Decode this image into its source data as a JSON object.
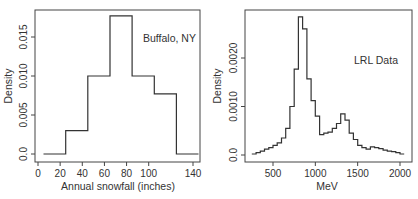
{
  "chart_data": [
    {
      "type": "bar",
      "subtype": "histogram",
      "title": "",
      "annotation": "Buffalo, NY",
      "xlabel": "Annual snowfall (inches)",
      "ylabel": "Density",
      "xticks": [
        0,
        20,
        40,
        60,
        80,
        100,
        140
      ],
      "yticks": [
        "0.0",
        "0.005",
        "0.010",
        "0.015"
      ],
      "xlim": [
        0,
        150
      ],
      "ylim": [
        0,
        0.018
      ],
      "grid": false,
      "bin_edges": [
        5,
        25,
        45,
        65,
        85,
        105,
        125,
        145
      ],
      "values": [
        0.0,
        0.003,
        0.01,
        0.0177,
        0.01,
        0.0077,
        0.0
      ]
    },
    {
      "type": "bar",
      "subtype": "histogram",
      "title": "",
      "annotation": "LRL Data",
      "xlabel": "MeV",
      "ylabel": "Density",
      "xticks": [
        500,
        1000,
        1500,
        2000
      ],
      "yticks": [
        "0.0",
        "0.0010",
        "0.0020"
      ],
      "xlim": [
        200,
        2100
      ],
      "ylim": [
        0,
        0.0029
      ],
      "grid": false,
      "bin_edges": [
        250,
        300,
        350,
        400,
        450,
        500,
        550,
        600,
        650,
        700,
        750,
        800,
        850,
        900,
        950,
        1000,
        1050,
        1100,
        1150,
        1200,
        1250,
        1300,
        1350,
        1400,
        1450,
        1500,
        1550,
        1600,
        1650,
        1700,
        1750,
        1800,
        1850,
        1900,
        1950,
        2000,
        2050
      ],
      "values": [
        2e-05,
        5e-05,
        8e-05,
        0.00012,
        0.00015,
        0.0002,
        0.00025,
        0.00035,
        0.00055,
        0.001,
        0.00177,
        0.00285,
        0.0026,
        0.00157,
        0.00112,
        0.0008,
        0.00042,
        0.00045,
        0.00047,
        0.00055,
        0.00065,
        0.00085,
        0.00072,
        0.00045,
        0.00032,
        0.0002,
        0.00015,
        0.00012,
        0.00017,
        0.00015,
        0.00013,
        0.0001,
        8e-05,
        7e-05,
        5e-05,
        2e-05
      ]
    }
  ]
}
